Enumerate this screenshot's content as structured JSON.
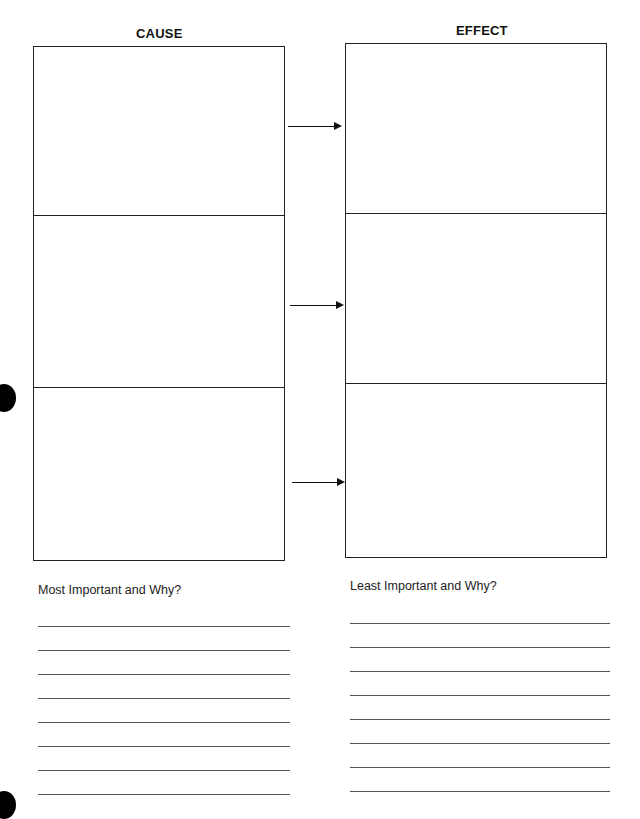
{
  "worksheet": {
    "cause_title": "CAUSE",
    "effect_title": "EFFECT",
    "rows": 3,
    "arrows": 3,
    "most_important_prompt": "Most Important and Why?",
    "least_important_prompt": "Least Important and Why?",
    "writing_lines_per_column": 8
  },
  "colors": {
    "ink": "#222222",
    "paper": "#ffffff"
  }
}
